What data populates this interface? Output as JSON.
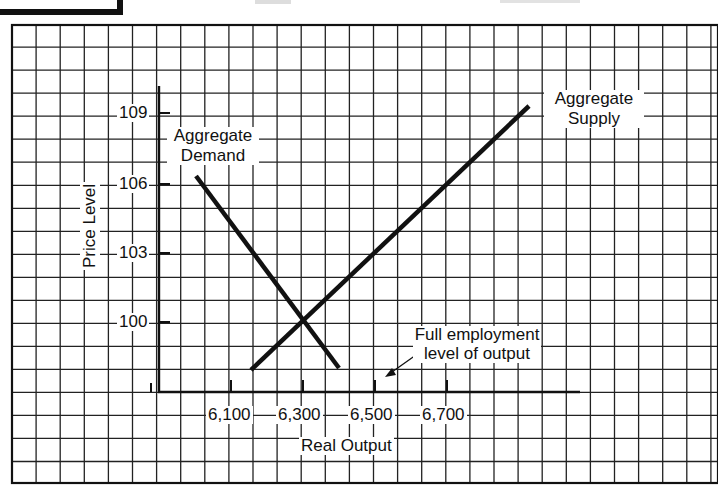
{
  "chart_data": {
    "type": "line",
    "title": "",
    "xlabel": "Real Output",
    "ylabel": "Price Level",
    "x_ticks": [
      "6,100",
      "6,300",
      "6,500",
      "6,700"
    ],
    "y_ticks": [
      "100",
      "103",
      "106",
      "109"
    ],
    "grid": true,
    "xlim": [
      5900,
      7100
    ],
    "ylim": [
      97.4,
      110
    ],
    "series": [
      {
        "name": "Aggregate Demand",
        "label_lines": [
          "Aggregate",
          "Demand"
        ],
        "points": [
          {
            "x": 6080,
            "y": 106.3
          },
          {
            "x": 6400,
            "y": 98.0
          }
        ]
      },
      {
        "name": "Aggregate Supply",
        "label_lines": [
          "Aggregate",
          "Supply"
        ],
        "points": [
          {
            "x": 6230,
            "y": 98.0
          },
          {
            "x": 6860,
            "y": 109.4
          }
        ]
      }
    ],
    "equilibrium": {
      "x": 6300,
      "y": 100
    },
    "annotations": [
      {
        "text_lines": [
          "Full employment",
          "level of output"
        ],
        "points_to": {
          "x": 6500,
          "y": 97.9
        }
      }
    ]
  },
  "labels": {
    "ad_line1": "Aggregate",
    "ad_line2": "Demand",
    "as_line1": "Aggregate",
    "as_line2": "Supply",
    "fe_line1": "Full employment",
    "fe_line2": "level of output",
    "xlabel": "Real Output",
    "ylabel": "Price Level",
    "y109": "109",
    "y106": "106",
    "y103": "103",
    "y100": "100",
    "x6100": "6,100",
    "x6300": "6,300",
    "x6500": "6,500",
    "x6700": "6,700"
  }
}
